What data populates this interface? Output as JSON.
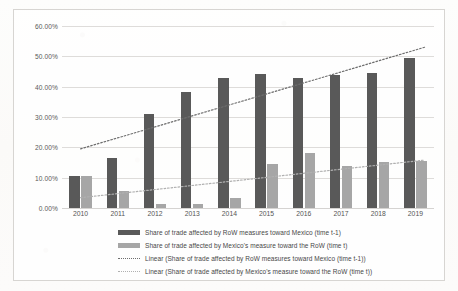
{
  "chart_data": {
    "type": "bar",
    "title": "",
    "xlabel": "",
    "ylabel": "",
    "categories": [
      "2010",
      "2011",
      "2012",
      "2013",
      "2014",
      "2015",
      "2016",
      "2017",
      "2018",
      "2019"
    ],
    "ylim": [
      0,
      60
    ],
    "ytick_labels": [
      "0.00%",
      "10.00%",
      "20.00%",
      "30.00%",
      "40.00%",
      "50.00%",
      "60.00%"
    ],
    "ytick_values": [
      0,
      10,
      20,
      30,
      40,
      50,
      60
    ],
    "grid": true,
    "legend_position": "bottom",
    "series": [
      {
        "name": "Share of trade affected by RoW measures toward Mexico (time t-1)",
        "kind": "bar",
        "color": "#595959",
        "values": [
          10.4,
          16.5,
          31.0,
          38.2,
          42.8,
          44.2,
          42.9,
          43.8,
          44.5,
          49.3
        ]
      },
      {
        "name": "Share of trade affected by Mexico's measure toward the RoW (time t)",
        "kind": "bar",
        "color": "#a6a6a6",
        "values": [
          10.7,
          5.5,
          1.3,
          1.2,
          3.3,
          14.5,
          18.1,
          13.9,
          15.2,
          15.4
        ]
      },
      {
        "name": "Linear (Share of trade affected by RoW measures toward Mexico (time t-1))",
        "kind": "trendline",
        "color": "#6e6e6e",
        "endpoints": [
          19.5,
          53.0
        ]
      },
      {
        "name": "Linear (Share of trade affected by Mexico's measure toward the RoW (time t))",
        "kind": "trendline",
        "color": "#b0b0b0",
        "endpoints": [
          3.4,
          15.8
        ]
      }
    ]
  },
  "legend": {
    "items": [
      {
        "label": "Share of trade affected by RoW measures toward Mexico (time t-1)",
        "swatch": "dark-bar-swatch"
      },
      {
        "label": "Share of trade affected by Mexico's measure toward the RoW (time t)",
        "swatch": "light-bar-swatch"
      },
      {
        "label": "Linear (Share of trade affected by RoW measures toward Mexico (time t-1))",
        "swatch": "dark-dotted-line-swatch"
      },
      {
        "label": "Linear (Share of trade affected by Mexico's measure toward the RoW (time t))",
        "swatch": "light-dotted-line-swatch"
      }
    ]
  }
}
